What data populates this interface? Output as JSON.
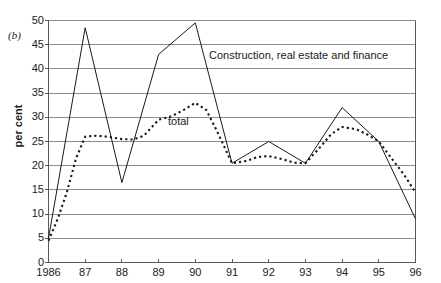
{
  "panel": {
    "label": "(b)"
  },
  "axes": {
    "ylabel": "per cent",
    "yticks": [
      "0",
      "5",
      "10",
      "15",
      "20",
      "25",
      "30",
      "35",
      "40",
      "45",
      "50"
    ],
    "xticks": [
      "1986",
      "87",
      "88",
      "89",
      "90",
      "91",
      "92",
      "93",
      "94",
      "95",
      "96"
    ]
  },
  "labels": {
    "construction": "Construction, real estate and finance",
    "total": "total"
  },
  "colors": {
    "axis": "#595959",
    "grid": "#8c8c8c",
    "line": "#1a1a1a",
    "text": "#1a1a1a",
    "background": "#ffffff"
  },
  "chart_data": {
    "type": "line",
    "title": "",
    "subtitle": "",
    "xlabel": "",
    "ylabel": "per cent",
    "xlim": [
      1986,
      1996
    ],
    "ylim": [
      0,
      50
    ],
    "ytick_step": 5,
    "grid": "horizontal",
    "legend": "inline-annotations",
    "categories": [
      "1986",
      "87",
      "88",
      "89",
      "90",
      "91",
      "92",
      "93",
      "94",
      "95",
      "96"
    ],
    "x": [
      1986,
      1987,
      1988,
      1989,
      1990,
      1991,
      1992,
      1993,
      1994,
      1995,
      1996
    ],
    "series": [
      {
        "name": "Construction, real estate and finance",
        "style": "solid",
        "values": [
          5.0,
          48.5,
          16.5,
          43.0,
          49.5,
          20.5,
          25.0,
          20.5,
          32.0,
          25.0,
          9.0
        ]
      },
      {
        "name": "total",
        "style": "dotted",
        "values": [
          4.5,
          26.0,
          25.5,
          29.5,
          33.0,
          20.5,
          22.0,
          20.5,
          28.0,
          25.0,
          14.5
        ],
        "x_detail": [
          1986.0,
          1986.25,
          1986.5,
          1986.75,
          1987.0,
          1987.3,
          1987.6,
          1988.0,
          1988.3,
          1988.6,
          1989.0,
          1989.35,
          1989.7,
          1990.0,
          1990.3,
          1990.6,
          1991.0,
          1991.4,
          1991.7,
          1992.0,
          1992.4,
          1992.7,
          1993.0,
          1993.4,
          1993.7,
          1994.0,
          1994.4,
          1994.7,
          1995.0,
          1995.35,
          1995.7,
          1996.0
        ],
        "y_detail": [
          4.5,
          9.0,
          14.5,
          21.5,
          26.0,
          26.2,
          26.0,
          25.5,
          25.4,
          26.2,
          29.5,
          30.2,
          31.6,
          33.0,
          31.5,
          27.0,
          20.5,
          21.0,
          21.8,
          22.0,
          21.3,
          20.6,
          20.5,
          23.8,
          26.5,
          28.0,
          27.5,
          26.4,
          25.0,
          21.5,
          18.0,
          14.5
        ]
      }
    ]
  }
}
